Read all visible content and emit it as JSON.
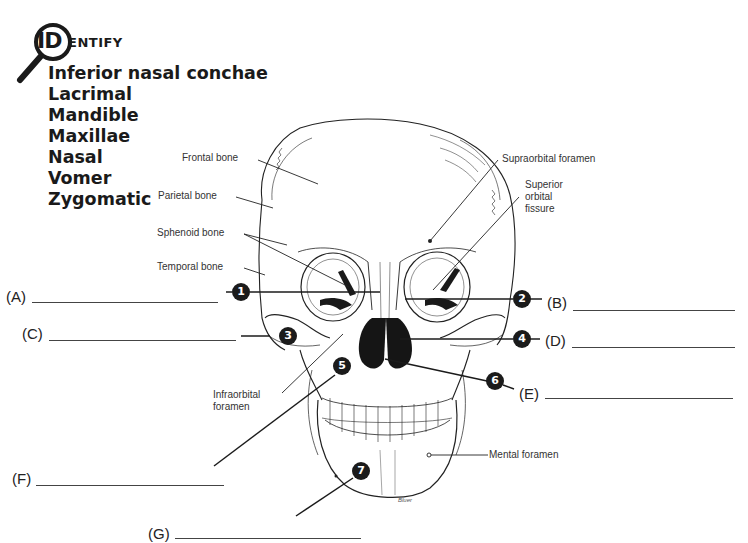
{
  "header": {
    "logo_big": "ID",
    "logo_rest": "ENTIFY"
  },
  "terms": [
    "Inferior nasal conchae",
    "Lacrimal",
    "Mandible",
    "Maxillae",
    "Nasal",
    "Vomer",
    "Zygomatic"
  ],
  "reference_labels": {
    "frontal": "Frontal bone",
    "parietal": "Parietal bone",
    "sphenoid": "Sphenoid bone",
    "temporal": "Temporal bone",
    "supraorbital": "Supraorbital foramen",
    "superior_orbital_1": "Superior",
    "superior_orbital_2": "orbital",
    "superior_orbital_3": "fissure",
    "infraorbital_1": "Infraorbital",
    "infraorbital_2": "foramen",
    "mental": "Mental foramen"
  },
  "markers": [
    "1",
    "2",
    "3",
    "4",
    "5",
    "6",
    "7"
  ],
  "answers": {
    "A": "(A)",
    "B": "(B)",
    "C": "(C)",
    "D": "(D)",
    "E": "(E)",
    "F": "(F)",
    "G": "(G)"
  },
  "signature": "Bluer"
}
